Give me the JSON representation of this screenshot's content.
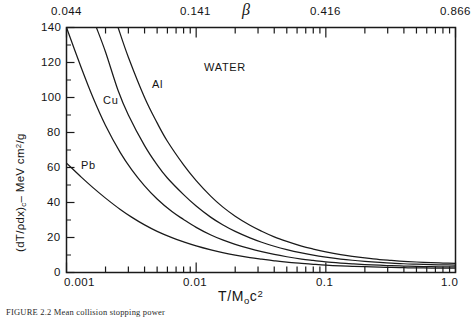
{
  "figure": {
    "caption": "FIGURE 2.2   Mean collision stopping power"
  },
  "chart_data": {
    "type": "line",
    "title": "",
    "xlabel": "T/M₀c²",
    "ylabel": "(dT/ρdx)c – MeV cm²/g",
    "top_axis_label": "β",
    "xscale": "log",
    "xlim": [
      0.001,
      1.0
    ],
    "ylim": [
      0,
      140
    ],
    "grid": false,
    "legend_position": "inline-annotations",
    "x_ticks_major": [
      "0.001",
      "0.01",
      "0.1",
      "1.0"
    ],
    "x_tick_values": [
      0.001,
      0.01,
      0.1,
      1.0
    ],
    "y_ticks": [
      "0",
      "20",
      "40",
      "60",
      "80",
      "100",
      "120",
      "140"
    ],
    "y_tick_values": [
      0,
      20,
      40,
      60,
      80,
      100,
      120,
      140
    ],
    "top_ticks": [
      "0.044",
      "0.141",
      "0.416",
      "0.866"
    ],
    "top_tick_x": [
      0.001,
      0.01,
      0.1,
      1.0
    ],
    "series": [
      {
        "name": "WATER",
        "label": "WATER",
        "label_x": 0.0115,
        "label_y": 117,
        "color": "#1a1a1a",
        "x": [
          0.0025,
          0.003,
          0.004,
          0.005,
          0.006,
          0.008,
          0.01,
          0.013,
          0.016,
          0.02,
          0.026,
          0.032,
          0.04,
          0.05,
          0.065,
          0.08,
          0.1,
          0.13,
          0.16,
          0.2,
          0.26,
          0.32,
          0.4,
          0.5,
          0.65,
          0.8,
          1.0
        ],
        "y": [
          140,
          123,
          100,
          85.5,
          75,
          61.5,
          52.5,
          43.5,
          37.5,
          32.2,
          27,
          23.6,
          20.4,
          17.8,
          15.1,
          13.4,
          11.8,
          10.2,
          9.2,
          8.3,
          7.4,
          6.9,
          6.4,
          6.0,
          5.6,
          5.4,
          5.2
        ]
      },
      {
        "name": "Al",
        "label": "Al",
        "label_x": 0.0046,
        "label_y": 107,
        "color": "#1a1a1a",
        "x": [
          0.0017,
          0.002,
          0.0025,
          0.003,
          0.004,
          0.005,
          0.006,
          0.008,
          0.01,
          0.013,
          0.016,
          0.02,
          0.026,
          0.032,
          0.04,
          0.05,
          0.065,
          0.08,
          0.1,
          0.13,
          0.16,
          0.2,
          0.26,
          0.32,
          0.4,
          0.5,
          0.65,
          0.8,
          1.0
        ],
        "y": [
          140,
          126,
          104,
          90,
          72.5,
          61.5,
          54,
          44.5,
          38,
          31.5,
          27.3,
          23.5,
          19.8,
          17.3,
          15.0,
          13.1,
          11.2,
          9.9,
          8.8,
          7.7,
          7.0,
          6.4,
          5.8,
          5.4,
          5.0,
          4.75,
          4.5,
          4.35,
          4.25
        ]
      },
      {
        "name": "Cu",
        "label": "Cu",
        "label_x": 0.0019,
        "label_y": 98,
        "color": "#1a1a1a",
        "x": [
          0.001,
          0.0013,
          0.0016,
          0.002,
          0.0026,
          0.0032,
          0.004,
          0.005,
          0.0065,
          0.008,
          0.01,
          0.013,
          0.016,
          0.02,
          0.026,
          0.032,
          0.04,
          0.05,
          0.065,
          0.08,
          0.1,
          0.13,
          0.16,
          0.2,
          0.26,
          0.32,
          0.4,
          0.5,
          0.65,
          0.8,
          1.0
        ],
        "y": [
          140,
          117,
          100,
          84,
          68.5,
          58.5,
          49.5,
          42,
          34.8,
          30.3,
          25.8,
          21.4,
          18.6,
          16.1,
          13.6,
          11.9,
          10.3,
          9.0,
          7.7,
          6.9,
          6.1,
          5.4,
          4.95,
          4.55,
          4.15,
          3.9,
          3.65,
          3.5,
          3.35,
          3.25,
          3.2
        ]
      },
      {
        "name": "Pb",
        "label": "Pb",
        "label_x": 0.0013,
        "label_y": 61,
        "color": "#1a1a1a",
        "x": [
          0.001,
          0.0013,
          0.0016,
          0.002,
          0.0026,
          0.0032,
          0.004,
          0.005,
          0.0065,
          0.008,
          0.01,
          0.013,
          0.016,
          0.02,
          0.026,
          0.032,
          0.04,
          0.05,
          0.065,
          0.08,
          0.1,
          0.13,
          0.16,
          0.2,
          0.26,
          0.32,
          0.4,
          0.5,
          0.65,
          0.8,
          1.0
        ],
        "y": [
          62.5,
          54.5,
          48.5,
          42.5,
          36.0,
          31.5,
          27.2,
          23.5,
          19.9,
          17.5,
          15.2,
          12.9,
          11.3,
          9.9,
          8.5,
          7.6,
          6.7,
          5.9,
          5.2,
          4.7,
          4.2,
          3.8,
          3.55,
          3.3,
          3.05,
          2.9,
          2.75,
          2.65,
          2.55,
          2.5,
          2.45
        ]
      }
    ]
  }
}
